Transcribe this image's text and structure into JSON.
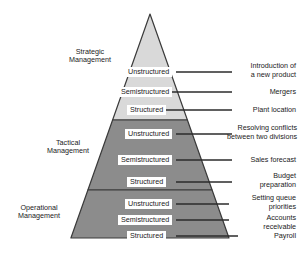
{
  "diagram": {
    "colors": {
      "strategic_fill": "#d9d9d9",
      "tactical_fill": "#8c8c8c",
      "operational_fill": "#8c8c8c",
      "outline": "#3a3a3a",
      "leader_line": "#2b2b2b",
      "text": "#1a1a1a",
      "background": "#ffffff"
    },
    "tiers": [
      {
        "id": "strategic",
        "caption_line1": "Strategic",
        "caption_line2": "Management",
        "fill": "#d9d9d9",
        "rows": [
          {
            "label": "Unstructured",
            "example_line1": "Introduction of",
            "example_line2": "a new product"
          },
          {
            "label": "Semistructured",
            "example_line1": "Mergers",
            "example_line2": ""
          },
          {
            "label": "Structured",
            "example_line1": "Plant location",
            "example_line2": ""
          }
        ]
      },
      {
        "id": "tactical",
        "caption_line1": "Tactical",
        "caption_line2": "Management",
        "fill": "#8c8c8c",
        "rows": [
          {
            "label": "Unstructured",
            "example_line1": "Resolving conflicts",
            "example_line2": "between two divisions"
          },
          {
            "label": "Semistructured",
            "example_line1": "Sales forecast",
            "example_line2": ""
          },
          {
            "label": "Structured",
            "example_line1": "Budget",
            "example_line2": "preparation"
          }
        ]
      },
      {
        "id": "operational",
        "caption_line1": "Operational",
        "caption_line2": "Management",
        "fill": "#8c8c8c",
        "rows": [
          {
            "label": "Unstructured",
            "example_line1": "Setting queue",
            "example_line2": "priorities"
          },
          {
            "label": "Semistructured",
            "example_line1": "Accounts",
            "example_line2": "receivable"
          },
          {
            "label": "Structured",
            "example_line1": "Payroll",
            "example_line2": ""
          }
        ]
      }
    ]
  }
}
